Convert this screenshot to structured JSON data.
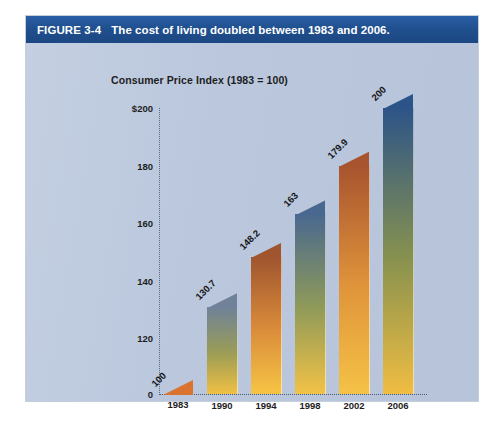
{
  "figure": {
    "number_label": "FIGURE 3-4",
    "caption": "The cost of living doubled between 1983 and 2006.",
    "banner_color": "#20508f",
    "panel_background": "#b9c6dc"
  },
  "chart_data": {
    "type": "bar",
    "title": "Consumer Price Index (1983 = 100)",
    "xlabel": "",
    "ylabel": "",
    "categories": [
      "1983",
      "1990",
      "1994",
      "1998",
      "2002",
      "2006"
    ],
    "values": [
      100,
      130.7,
      148.2,
      163,
      179.9,
      200
    ],
    "value_labels": [
      "100",
      "130.7",
      "148.2",
      "163",
      "179.9",
      "200"
    ],
    "ytick_labels": [
      "$200",
      "180",
      "160",
      "140",
      "120",
      "0"
    ],
    "ytick_values": [
      200,
      180,
      160,
      140,
      120,
      0
    ],
    "ylim": [
      100,
      210
    ],
    "axis_break": true,
    "grid": false,
    "legend": null,
    "bar_colors": [
      {
        "top": "#d9732f",
        "mid": "#e8a03c",
        "bottom": "#f7c64c"
      },
      {
        "top": "#6f8299",
        "mid": "#9a9c57",
        "bottom": "#f0c043"
      },
      {
        "top": "#a0552f",
        "mid": "#d98b3a",
        "bottom": "#f6c444"
      },
      {
        "top": "#49688f",
        "mid": "#8f9a59",
        "bottom": "#f2c246"
      },
      {
        "top": "#a8542f",
        "mid": "#df933a",
        "bottom": "#f5c246"
      },
      {
        "top": "#2d5488",
        "mid": "#86914f",
        "bottom": "#f0bd42"
      }
    ]
  }
}
